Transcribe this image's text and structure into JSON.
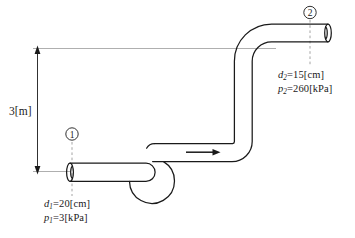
{
  "diagram": {
    "background_color": "#ffffff",
    "line_color": "#1a1a1a",
    "guide_color": "#8c8c8c",
    "dashed_color": "#9a9a9a",
    "height_dimension": {
      "label": "3[m]",
      "value": 3,
      "unit": "m"
    },
    "flow_arrow": {
      "direction": "right",
      "label": ""
    },
    "stations": [
      {
        "marker": "①",
        "marker_number": "1",
        "diameter_text": "=20[cm]",
        "diameter_symbol": "d",
        "diameter_sub": "1",
        "diameter_value": 20,
        "diameter_unit": "cm",
        "pressure_symbol": "p",
        "pressure_sub": "1",
        "pressure_text": "=3[kPa]",
        "pressure_value": 3,
        "pressure_unit": "kPa"
      },
      {
        "marker": "②",
        "marker_number": "2",
        "diameter_text": "=15[cm]",
        "diameter_symbol": "d",
        "diameter_sub": "2",
        "diameter_value": 15,
        "diameter_unit": "cm",
        "pressure_symbol": "p",
        "pressure_sub": "2",
        "pressure_text": "=260[kPa]",
        "pressure_value": 260,
        "pressure_unit": "kPa"
      }
    ]
  }
}
